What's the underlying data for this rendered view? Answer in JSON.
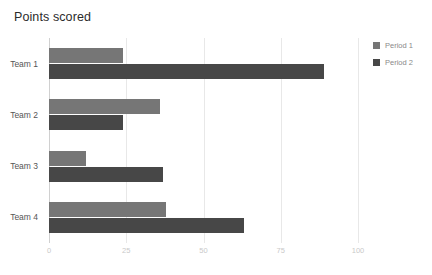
{
  "chart_data": {
    "type": "bar",
    "orientation": "horizontal",
    "title": "Points scored",
    "xlabel": "",
    "ylabel": "",
    "categories": [
      "Team 1",
      "Team 2",
      "Team 3",
      "Team 4"
    ],
    "series": [
      {
        "name": "Period 1",
        "color": "#767676",
        "values": [
          24,
          36,
          12,
          38
        ]
      },
      {
        "name": "Period 2",
        "color": "#474747",
        "values": [
          89,
          24,
          37,
          63
        ]
      }
    ],
    "xlim": [
      0,
      100
    ],
    "xticks": [
      0,
      25,
      50,
      75,
      100
    ],
    "xtick_labels": [
      "0",
      "25",
      "50",
      "75",
      "100"
    ],
    "grid": true,
    "grid_axis": "x",
    "legend_position": "right"
  },
  "legend": {
    "items": [
      {
        "label": "Period 1",
        "color": "#767676"
      },
      {
        "label": "Period 2",
        "color": "#474747"
      }
    ]
  },
  "colors": {
    "background": "#ffffff",
    "title_text": "#2b2b2b",
    "category_text": "#555555",
    "tick_text": "#c9c9c9",
    "gridline": "#e8e8e8",
    "axis_line": "#d0d0d0",
    "legend_text": "#8a8a8a"
  }
}
